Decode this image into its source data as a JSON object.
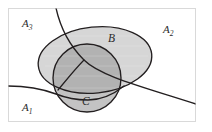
{
  "figure": {
    "frame": {
      "border_color": "#d9d9d9",
      "background": "#ffffff",
      "x": 8,
      "y": 8,
      "width": 188,
      "height": 114
    },
    "stroke_color": "#231f20",
    "colors": {
      "ellipse_fill": "#d6d6d6",
      "circle_fill": "#c0c0c0",
      "overlap_fill": "#b3b3b3",
      "outline": "#231f20",
      "frame": "#d9d9d9",
      "label_text": "#2b2b2b"
    },
    "region_labels": [
      {
        "id": "A3",
        "base": "A",
        "subscript": "3",
        "x": 22,
        "y": 27,
        "description": "upper-left region"
      },
      {
        "id": "A2",
        "base": "A",
        "subscript": "2",
        "x": 163,
        "y": 33,
        "description": "upper-right region"
      },
      {
        "id": "A1",
        "base": "A",
        "subscript": "1",
        "x": 22,
        "y": 111,
        "description": "lower-left region"
      }
    ],
    "set_labels": [
      {
        "id": "B",
        "text": "B",
        "x": 108,
        "y": 42,
        "description": "large ellipse"
      },
      {
        "id": "C",
        "text": "C",
        "x": 82,
        "y": 105,
        "description": "circle"
      }
    ],
    "shapes": {
      "ellipse_B": {
        "cx": 95,
        "cy": 60,
        "rx": 57,
        "ry": 33,
        "rotation": -6
      },
      "circle_C": {
        "cx": 87,
        "cy": 78,
        "r": 34
      }
    },
    "curves": {
      "curve_upper": "descending curve entering from top edge, crossing the ellipse and circle, exiting at right edge",
      "curve_lower": "near-horizontal curve entering from left edge, passing beneath the circle"
    }
  }
}
